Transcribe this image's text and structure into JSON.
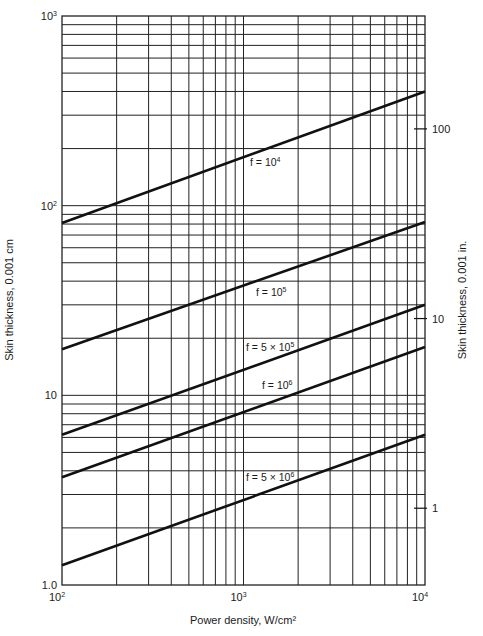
{
  "chart_data": {
    "type": "line",
    "title": "",
    "xlabel": "Power density, W/cm²",
    "ylabel": "Skin thickness, 0.001 cm",
    "ylabel_right": "Skin thickness, 0.001 in.",
    "xscale": "log",
    "yscale": "log",
    "xlim": [
      100,
      10000
    ],
    "ylim": [
      1,
      1000
    ],
    "grid": true,
    "x_ticks": [
      {
        "value": 100,
        "base": "10",
        "exp": "2"
      },
      {
        "value": 1000,
        "base": "10",
        "exp": "3"
      },
      {
        "value": 10000,
        "base": "10",
        "exp": "4"
      }
    ],
    "y_ticks_left": [
      {
        "value": 1,
        "label": "1.0"
      },
      {
        "value": 10,
        "label": "10"
      },
      {
        "value": 100,
        "base": "10",
        "exp": "2"
      },
      {
        "value": 1000,
        "base": "10",
        "exp": "3"
      }
    ],
    "y_ticks_right": [
      {
        "label": "100",
        "value_cm": 254
      },
      {
        "label": "10",
        "value_cm": 25.4
      },
      {
        "label": "1",
        "value_cm": 2.54
      }
    ],
    "series": [
      {
        "name": "f = 10⁴",
        "label_base": "f = 10",
        "label_exp": "4",
        "x": [
          100,
          10000
        ],
        "y": [
          81,
          400
        ]
      },
      {
        "name": "f = 10⁵",
        "label_base": "f = 10",
        "label_exp": "5",
        "x": [
          100,
          10000
        ],
        "y": [
          17.5,
          82
        ]
      },
      {
        "name": "f = 5 × 10⁵",
        "label_base": "f = 5 × 10",
        "label_exp": "5",
        "x": [
          100,
          10000
        ],
        "y": [
          6.2,
          30
        ]
      },
      {
        "name": "f = 10⁶",
        "label_base": "f = 10",
        "label_exp": "6",
        "x": [
          100,
          10000
        ],
        "y": [
          3.7,
          18
        ]
      },
      {
        "name": "f = 5 × 10⁶",
        "label_base": "f = 5 × 10",
        "label_exp": "6",
        "x": [
          100,
          10000
        ],
        "y": [
          1.27,
          6.2
        ]
      }
    ],
    "legend": "inline labels on curves"
  }
}
